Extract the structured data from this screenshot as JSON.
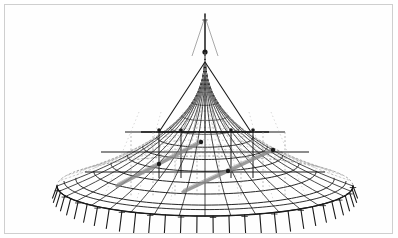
{
  "document": {
    "kind": "technical-line-drawing",
    "subject": "Tent / dome structural wireframe",
    "title": "",
    "caption": "",
    "background_color": "#ffffff",
    "frame_color": "#cfcfcf",
    "ink_color": "#1a1a1a",
    "secondary_ink_color": "#6f6f6f",
    "hidden_line_color": "#9a9a9a"
  },
  "frame": {
    "x": 4,
    "y": 4,
    "width": 389,
    "height": 230,
    "stroke_width": 1
  },
  "figure": {
    "name": "tent-dome-wireframe",
    "center_x": 205,
    "apex": {
      "x": 205,
      "y": 52
    },
    "mast": {
      "top_y": 18,
      "bottom_y": 52,
      "tip_y": 14
    },
    "dome": {
      "rim_center_y": 186,
      "rim_rx": 148,
      "rim_ry": 30,
      "cone_base_y": 130,
      "cone_rx": 96,
      "cone_ry": 20,
      "skirt_bulge": 0.55
    },
    "ribs": {
      "count": 36,
      "stroke_width": 0.8
    },
    "rings": {
      "count": 11,
      "stroke_width": 0.7
    },
    "legs": {
      "count": 30,
      "length": 22,
      "stroke_width": 1.1
    },
    "truss": {
      "apex_y": 62,
      "tie_y": 132,
      "half_span": 46
    },
    "struts": {
      "count": 2,
      "color": "#8a8a8a",
      "stroke_width": 3.2
    },
    "nodes": {
      "count": 9,
      "radius": 2.2
    }
  },
  "chart_data": {
    "type": "scatter",
    "title": "Tent / dome structural wireframe",
    "xlabel": "",
    "ylabel": "",
    "categories": [],
    "values": []
  }
}
